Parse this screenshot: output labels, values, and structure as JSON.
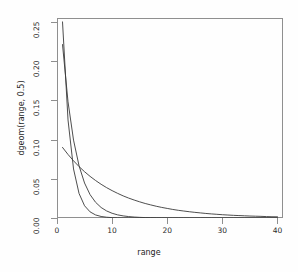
{
  "chart_data": {
    "type": "line",
    "title": "",
    "xlabel": "range",
    "ylabel": "dgeom(range, 0.5)",
    "xlim": [
      0,
      41
    ],
    "ylim": [
      0,
      0.255
    ],
    "xticks": [
      0,
      10,
      20,
      30,
      40
    ],
    "xtick_labels": [
      "0",
      "10",
      "20",
      "30",
      "40"
    ],
    "yticks": [
      0.0,
      0.05,
      0.1,
      0.15,
      0.2,
      0.25
    ],
    "ytick_labels": [
      "0.00",
      "0.05",
      "0.10",
      "0.15",
      "0.20",
      "0.25"
    ],
    "grid": false,
    "legend": "none",
    "line_color": "#3a3a3a",
    "box_color": "#8f8f8f",
    "background": "#fefefe",
    "x": [
      1,
      2,
      3,
      4,
      5,
      6,
      7,
      8,
      9,
      10,
      11,
      12,
      13,
      14,
      15,
      16,
      17,
      18,
      19,
      20,
      21,
      22,
      23,
      24,
      25,
      26,
      27,
      28,
      29,
      30,
      31,
      32,
      33,
      34,
      35,
      36,
      37,
      38,
      39,
      40
    ],
    "series": [
      {
        "name": "dgeom(range, 0.5)",
        "p": 0.5,
        "values": [
          0.25,
          0.125,
          0.0625,
          0.03125,
          0.015625,
          0.0078125,
          0.00390625,
          0.001953125,
          0.0009765625,
          0.00048828125,
          0.000244140625,
          0.0001220703125,
          6.103515625e-05,
          3.0517578125e-05,
          1.52587890625e-05,
          7.62939453125e-06,
          3.814697265625e-06,
          1.9073486328125e-06,
          9.5367431640625e-07,
          4.76837158203125e-07,
          2.384185791015625e-07,
          1.1920928955078125e-07,
          5.960464477539063e-08,
          2.980232238769531e-08,
          1.490116119384766e-08,
          7.450580596923828e-09,
          3.725290298461914e-09,
          1.862645149230957e-09,
          9.313225746154785e-10,
          4.656612873077393e-10,
          2.328306436538696e-10,
          1.164153218269348e-10,
          5.82076609134674e-11,
          2.91038304567337e-11,
          1.455191522836685e-11,
          7.275957614183426e-12,
          3.637978807091713e-12,
          1.818989403545856e-12,
          9.09494701772928e-13,
          4.54747350886464e-13
        ]
      },
      {
        "name": "dgeom(range, 0.33)",
        "p": 0.33,
        "values": [
          0.2211,
          0.1481,
          0.0993,
          0.0665,
          0.0446,
          0.0298,
          0.02,
          0.0134,
          0.009,
          0.006,
          0.004,
          0.0027,
          0.0018,
          0.0012,
          0.0008,
          0.00055,
          0.00037,
          0.00025,
          0.00016,
          0.00011,
          7e-05,
          5e-05,
          3e-05,
          2e-05,
          1.5e-05,
          1e-05,
          6.7e-06,
          4.5e-06,
          3e-06,
          2e-06,
          1.3e-06,
          9e-07,
          6e-07,
          4e-07,
          2.7e-07,
          1.8e-07,
          1.2e-07,
          8e-08,
          5e-08,
          3.6e-08
        ]
      },
      {
        "name": "dgeom(range, 0.1)",
        "p": 0.1,
        "values": [
          0.09,
          0.081,
          0.0729,
          0.0656,
          0.059,
          0.0531,
          0.0478,
          0.043,
          0.0387,
          0.0349,
          0.0314,
          0.0282,
          0.0254,
          0.0229,
          0.0206,
          0.0185,
          0.0167,
          0.015,
          0.0135,
          0.0122,
          0.0109,
          0.0098,
          0.0089,
          0.008,
          0.0072,
          0.0065,
          0.0058,
          0.0052,
          0.0047,
          0.0042,
          0.0038,
          0.0034,
          0.0031,
          0.0028,
          0.0025,
          0.0023,
          0.0021,
          0.0018,
          0.0016,
          0.0015
        ]
      }
    ]
  }
}
